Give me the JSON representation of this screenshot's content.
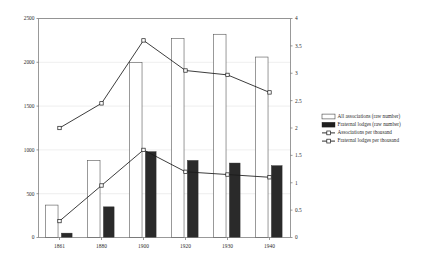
{
  "chart_data": {
    "type": "bar",
    "title": "",
    "subtitle": "",
    "xlabel": "",
    "ylabel": "",
    "y2label": "",
    "categories": [
      "1861",
      "1880",
      "1900",
      "1920",
      "1930",
      "1940"
    ],
    "ylim": [
      0,
      2500
    ],
    "y2lim": [
      0,
      4
    ],
    "yticks": [
      "0",
      "500",
      "1000",
      "1500",
      "2000",
      "2500"
    ],
    "ytick_values": [
      0,
      500,
      1000,
      1500,
      2000,
      2500
    ],
    "y2ticks": [
      "0",
      "0.5",
      "1",
      "1.5",
      "2",
      "2.5",
      "3",
      "3.5",
      "4"
    ],
    "y2tick_values": [
      0,
      0.5,
      1,
      1.5,
      2,
      2.5,
      3,
      3.5,
      4
    ],
    "grid": true,
    "legend_position": "right-middle",
    "series": [
      {
        "name": "All associations (raw number)",
        "kind": "bar",
        "style": "open",
        "axis": "left",
        "values": [
          370,
          880,
          2000,
          2270,
          2320,
          2060
        ]
      },
      {
        "name": "Fraternal lodges (raw number)",
        "kind": "bar",
        "style": "solid",
        "axis": "left",
        "values": [
          50,
          350,
          980,
          880,
          850,
          820
        ]
      },
      {
        "name": "Associations per thousand",
        "kind": "line",
        "style": "line-marker",
        "axis": "right",
        "values": [
          0.3,
          0.95,
          1.6,
          1.2,
          1.15,
          1.1
        ]
      },
      {
        "name": "Fraternal lodges per thousand",
        "kind": "line",
        "style": "line-marker",
        "axis": "right",
        "values": [
          2.0,
          2.45,
          3.6,
          3.05,
          2.97,
          2.65
        ]
      }
    ]
  },
  "legend": {
    "items": [
      {
        "label": "All associations (raw number)",
        "marker": "open-square-swatch"
      },
      {
        "label": "Fraternal lodges (raw number)",
        "marker": "solid-square-swatch"
      },
      {
        "label": "Associations per thousand",
        "marker": "line-open-marker"
      },
      {
        "label": "Fraternal lodges per thousand",
        "marker": "line-open-marker"
      }
    ]
  },
  "colors": {
    "bar_open_fill": "#ffffff",
    "bar_open_stroke": "#555555",
    "bar_solid_fill": "#2a2a2a",
    "line_stroke": "#1a1a1a",
    "grid": "#e2e2e2",
    "axis": "#6d6d6d",
    "text": "#2b2b2b",
    "background": "#ffffff"
  }
}
